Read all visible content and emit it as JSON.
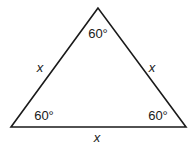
{
  "diagram": {
    "type": "equilateral-triangle",
    "stroke_color": "#1a1a1a",
    "vertices": {
      "top": [
        98,
        8
      ],
      "bottom_left": [
        11,
        127
      ],
      "bottom_right": [
        186,
        127
      ]
    },
    "angles": {
      "top": "60°",
      "bottom_left": "60°",
      "bottom_right": "60°"
    },
    "sides": {
      "left": "x",
      "right": "x",
      "bottom": "x"
    }
  }
}
